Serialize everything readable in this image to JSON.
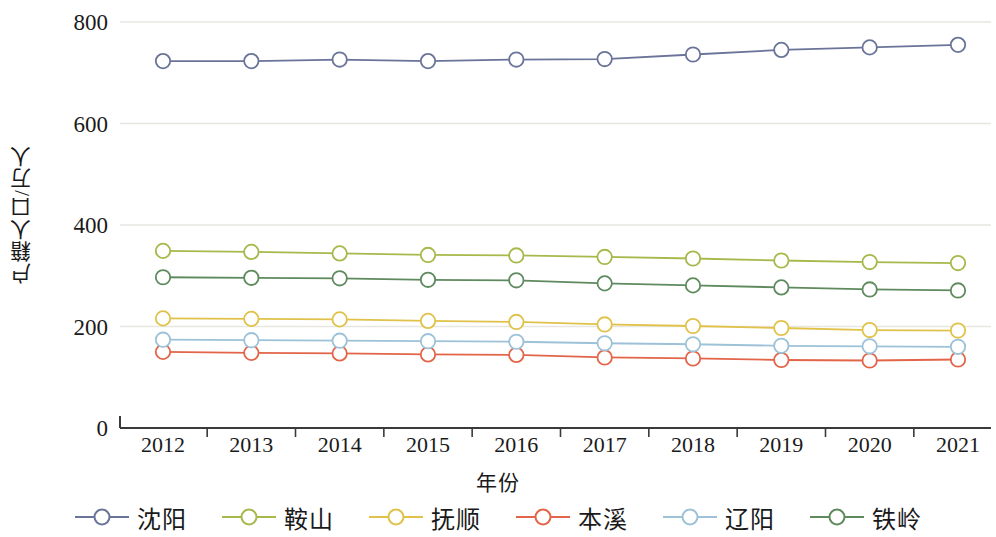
{
  "chart_data": {
    "type": "line",
    "title": "",
    "xlabel": "年份",
    "ylabel": "户籍人口/万人",
    "categories": [
      "2012",
      "2013",
      "2014",
      "2015",
      "2016",
      "2017",
      "2018",
      "2019",
      "2020",
      "2021"
    ],
    "ylim": [
      0,
      800
    ],
    "yticks": [
      0,
      200,
      400,
      600,
      800
    ],
    "grid": true,
    "legend_position": "bottom",
    "marker": "open-circle",
    "series": [
      {
        "name": "沈阳",
        "color": "#6a7499",
        "values": [
          723,
          723,
          726,
          723,
          726,
          727,
          736,
          745,
          750,
          755
        ]
      },
      {
        "name": "鞍山",
        "color": "#a8b84b",
        "values": [
          349,
          347,
          344,
          341,
          340,
          337,
          334,
          330,
          327,
          325
        ]
      },
      {
        "name": "抚顺",
        "color": "#e0c24a",
        "values": [
          216,
          215,
          214,
          211,
          209,
          204,
          201,
          197,
          193,
          192
        ]
      },
      {
        "name": "本溪",
        "color": "#e2654a",
        "values": [
          150,
          148,
          147,
          145,
          144,
          139,
          137,
          134,
          133,
          135
        ]
      },
      {
        "name": "辽阳",
        "color": "#9dc2d8",
        "values": [
          174,
          173,
          172,
          171,
          170,
          167,
          165,
          162,
          161,
          160
        ]
      },
      {
        "name": "铁岭",
        "color": "#5e8a5e",
        "values": [
          297,
          296,
          295,
          292,
          291,
          285,
          281,
          277,
          273,
          271
        ]
      }
    ],
    "legend_order": [
      "沈阳",
      "鞍山",
      "抚顺",
      "本溪",
      "辽阳",
      "铁岭"
    ]
  },
  "axes": {
    "y_label": "户籍人口/万人",
    "x_label": "年份"
  }
}
